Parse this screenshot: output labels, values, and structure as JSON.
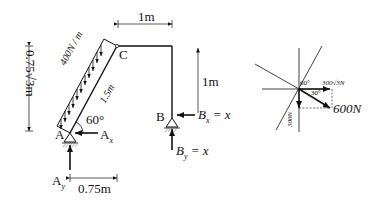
{
  "frame": {
    "distributed_load": "400N / m",
    "member_length": "1.5m",
    "point_A": "A",
    "point_B": "B",
    "point_C": "C",
    "angle_A": "60°",
    "Ax": "A",
    "Ax_sub": "x",
    "Ay": "A",
    "Ay_sub": "y",
    "Bx": "B",
    "Bx_sub": "x",
    "Bx_val": " = x",
    "By": "B",
    "By_sub": "y",
    "By_val": " = x",
    "dim_top": "1m",
    "dim_right": "1m",
    "dim_bottom": "0.75m",
    "dim_left": "0.75√3m"
  },
  "force_diagram": {
    "angle_60": "60°",
    "angle_30": "30°",
    "horizontal_component": "300√3N",
    "vertical_component": "300N",
    "resultant": "600N"
  }
}
